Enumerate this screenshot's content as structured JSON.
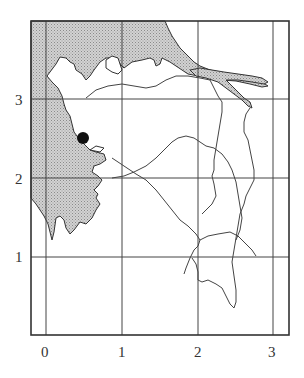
{
  "map": {
    "axes": {
      "x_ticks": [
        "0",
        "1",
        "2",
        "3"
      ],
      "y_ticks": [
        "1",
        "2",
        "3"
      ]
    },
    "features": {
      "land_shaded": "sea/water area (stippled grey, upper-left)",
      "marker": "filled black dot near coast at approx (0.5, 2.45)",
      "river": "shaded river channel along top-right",
      "boundaries": "thin outline lines dividing interior regions"
    },
    "colors": {
      "shade": "#c8c8c8",
      "line": "#333333",
      "grid": "#444444",
      "marker": "#111111"
    }
  }
}
